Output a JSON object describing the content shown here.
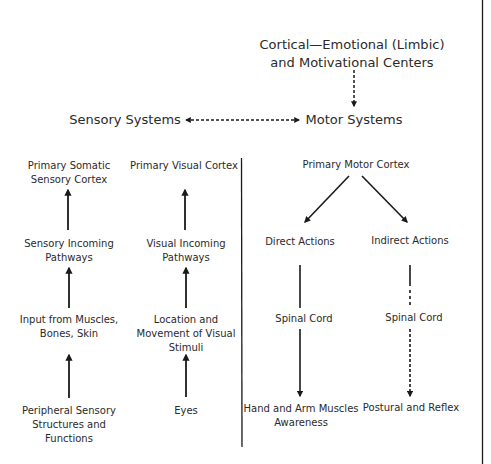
{
  "top": {
    "cortical": [
      "Cortical—Emotional (Limbic)",
      "and Motivational Centers"
    ],
    "sensory_systems": "Sensory Systems",
    "motor_systems": "Motor Systems"
  },
  "sensory_somatic": {
    "nodes": [
      [
        "Primary Somatic",
        "Sensory Cortex"
      ],
      [
        "Sensory Incoming",
        "Pathways"
      ],
      [
        "Input from Muscles,",
        "Bones, Skin"
      ],
      [
        "Peripheral Sensory",
        "Structures and",
        "Functions"
      ]
    ]
  },
  "sensory_visual": {
    "nodes": [
      [
        "Primary Visual Cortex"
      ],
      [
        "Visual Incoming",
        "Pathways"
      ],
      [
        "Location and",
        "Movement of Visual",
        "Stimuli"
      ],
      [
        "Eyes"
      ]
    ]
  },
  "motor": {
    "root": "Primary Motor Cortex",
    "direct": {
      "label": "Direct Actions",
      "relay": "Spinal Cord",
      "target": [
        "Hand and Arm Muscles",
        "Awareness"
      ]
    },
    "indirect": {
      "label": "Indirect Actions",
      "relay": "Spinal Cord",
      "target": [
        "Postural and Reflex"
      ]
    }
  },
  "colors": {
    "ink": "#1a1a1a",
    "text": "#2a2a2a",
    "background": "#ffffff"
  }
}
